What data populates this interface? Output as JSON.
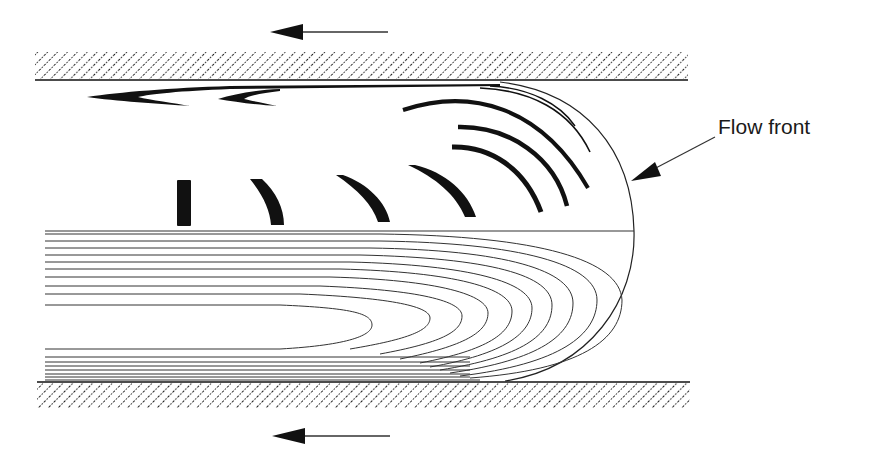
{
  "diagram": {
    "type": "fountain-flow-schematic",
    "labels": {
      "flow_front": "Flow front"
    },
    "colors": {
      "ink": "#111111",
      "background": "#ffffff"
    },
    "walls": [
      {
        "id": "top-wall",
        "x1": 35,
        "x2": 688,
        "y_top": 52,
        "y_edge": 80
      },
      {
        "id": "bottom-wall",
        "x1": 37,
        "x2": 690,
        "y_edge": 382,
        "y_bottom": 408
      }
    ],
    "wall_motion_arrows": [
      {
        "id": "top-arrow",
        "direction": "left",
        "tail_x": 388,
        "tip_x": 270,
        "y": 32
      },
      {
        "id": "bottom-arrow",
        "direction": "left",
        "tail_x": 390,
        "tip_x": 272,
        "y": 436
      }
    ],
    "flow_front_pointer": {
      "from": [
        715,
        137
      ],
      "to": [
        632,
        182
      ]
    },
    "centerline_y": 231,
    "markers_count": 10,
    "streamline_count": 18
  }
}
